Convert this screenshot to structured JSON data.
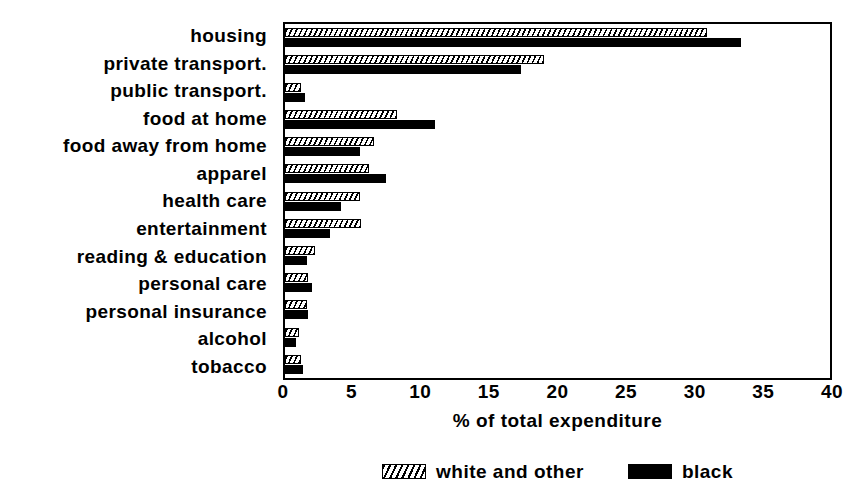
{
  "chart_data": {
    "type": "bar",
    "orientation": "horizontal",
    "title": "",
    "xlabel": "% of total expenditure",
    "ylabel": "",
    "xlim": [
      0,
      40
    ],
    "xticks": [
      0,
      5,
      10,
      15,
      20,
      25,
      30,
      35,
      40
    ],
    "xtick_labels": [
      "0",
      "5",
      "10",
      "15",
      "20",
      "25",
      "30",
      "35",
      "40"
    ],
    "grid": false,
    "legend_position": "bottom",
    "categories": [
      "housing",
      "private transport.",
      "public transport.",
      "food at home",
      "food away from home",
      "apparel",
      "health care",
      "entertainment",
      "reading & education",
      "personal care",
      "personal insurance",
      "alcohol",
      "tobacco"
    ],
    "series": [
      {
        "name": "white and other",
        "fill": "hatched",
        "color": "#ffffff",
        "values": [
          31.0,
          19.0,
          1.2,
          8.2,
          6.5,
          6.2,
          5.5,
          5.6,
          2.2,
          1.7,
          1.6,
          1.0,
          1.2
        ]
      },
      {
        "name": "black",
        "fill": "solid",
        "color": "#000000",
        "values": [
          33.5,
          17.3,
          1.5,
          11.0,
          5.5,
          7.4,
          4.1,
          3.3,
          1.6,
          2.0,
          1.7,
          0.8,
          1.3
        ]
      }
    ]
  },
  "axis": {
    "x_title": "% of total expenditure",
    "ticks": [
      "0",
      "5",
      "10",
      "15",
      "20",
      "25",
      "30",
      "35",
      "40"
    ]
  },
  "legend": {
    "entries": [
      {
        "label": "white and other",
        "swatch": "hatched-swatch"
      },
      {
        "label": "black",
        "swatch": "solid-black-swatch"
      }
    ]
  },
  "colors": {
    "foreground": "#000000",
    "background": "#ffffff"
  }
}
